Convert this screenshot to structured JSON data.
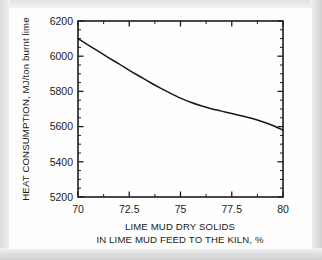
{
  "figure": {
    "background_color": "#fefefe",
    "frame_color": "#d9d9d9",
    "axis_color": "#1c1c1c",
    "curve_color": "#171717"
  },
  "chart_data": {
    "type": "line",
    "title": "",
    "xlabel_line1": "LIME MUD DRY SOLIDS",
    "xlabel_line2": "IN LIME MUD FEED TO THE KILN, %",
    "ylabel": "HEAT CONSUMPTION, MJ/ton burnt lime",
    "xlim": [
      70,
      80
    ],
    "ylim": [
      5200,
      6200
    ],
    "grid": false,
    "legend": false,
    "x_major_ticks": [
      70,
      72.5,
      75,
      77.5,
      80
    ],
    "x_major_tick_labels": [
      "70",
      "72.5",
      "75",
      "77.5",
      "80"
    ],
    "x_minor_ticks": [
      71.25,
      73.75,
      76.25,
      78.75
    ],
    "y_major_ticks": [
      5200,
      5400,
      5600,
      5800,
      6000,
      6200
    ],
    "y_major_tick_labels": [
      "5200",
      "5400",
      "5600",
      "5800",
      "6000",
      "6200"
    ],
    "y_minor_ticks": [
      5250,
      5300,
      5350,
      5450,
      5500,
      5550,
      5650,
      5700,
      5750,
      5850,
      5900,
      5950,
      6050,
      6100,
      6150
    ],
    "series": [
      {
        "name": "heat consumption",
        "x": [
          70.0,
          70.5,
          71.0,
          71.5,
          72.0,
          72.5,
          73.0,
          73.5,
          74.0,
          74.5,
          75.0,
          75.5,
          76.0,
          76.5,
          77.0,
          77.5,
          78.0,
          78.5,
          79.0,
          79.5,
          80.0
        ],
        "values": [
          6100,
          6063,
          6027,
          5991,
          5956,
          5920,
          5886,
          5852,
          5820,
          5790,
          5762,
          5738,
          5718,
          5702,
          5688,
          5674,
          5660,
          5646,
          5628,
          5606,
          5580
        ]
      }
    ]
  }
}
